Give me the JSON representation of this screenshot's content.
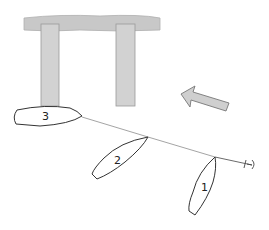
{
  "diagram": {
    "type": "sailing-situation",
    "colors": {
      "dock": "#c8c8c8",
      "dock_stroke": "#9a9a9a",
      "arrow_fill": "#cfcfcf",
      "arrow_stroke": "#777777",
      "boat_stroke": "#333333",
      "line": "#555555"
    },
    "dock": {
      "label": "dock"
    },
    "wind_arrow": {
      "direction": "from lower-right toward upper-left"
    },
    "boats": [
      {
        "id": "1",
        "label": "1"
      },
      {
        "id": "2",
        "label": "2"
      },
      {
        "id": "3",
        "label": "3"
      }
    ],
    "overlap_line": {
      "from": "boat 3",
      "to": "beyond boat 1",
      "end_symbol": "mark"
    }
  }
}
